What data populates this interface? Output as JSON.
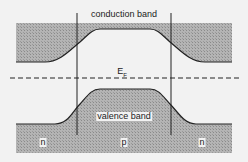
{
  "diagram": {
    "type": "energy band diagram (n-p-n junction)",
    "labels": {
      "conduction_band": "conduction band",
      "valence_band": "valence band",
      "fermi_level": "E",
      "fermi_subscript": "F",
      "region_left": "n",
      "region_middle": "p",
      "region_right": "n"
    },
    "colors": {
      "background": "#f2f2f2",
      "band_fill": "#a8a8a8",
      "line": "#222222"
    }
  }
}
